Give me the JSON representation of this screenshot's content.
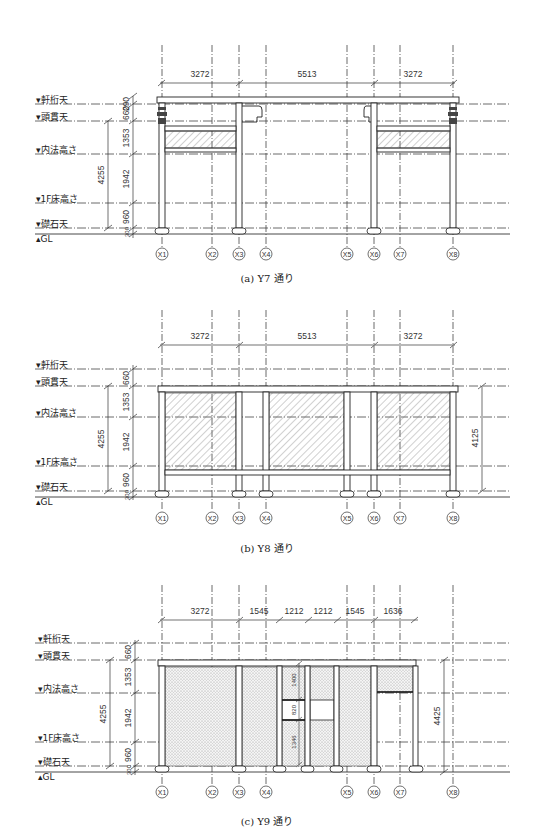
{
  "axes": {
    "x_labels": [
      "X1",
      "X2",
      "X3",
      "X4",
      "X5",
      "X6",
      "X7",
      "X8"
    ],
    "x_positions": [
      162,
      212,
      239,
      266,
      347,
      374,
      400,
      453
    ]
  },
  "levels": {
    "nokiketa": "軒桁天",
    "kashiranuki": "頭貫天",
    "uchinori": "内法高さ",
    "floor_1f": "1F床高さ",
    "soseki": "礎石天",
    "gl": "GL"
  },
  "vertical_dims": {
    "d290": "290",
    "d660": "660",
    "d1353": "1353",
    "d1942": "1942",
    "d960": "960",
    "d300": "300",
    "d4255": "4255"
  },
  "panels": [
    {
      "id": "a",
      "caption": "(a) Y7 通り",
      "top_dims": [
        "3272",
        "5513",
        "3272"
      ]
    },
    {
      "id": "b",
      "caption": "(b) Y8 通り",
      "top_dims": [
        "3272",
        "5513",
        "3272"
      ],
      "right_dim": "4125"
    },
    {
      "id": "c",
      "caption": "(c) Y9 通り",
      "top_dims": [
        "3272",
        "1545",
        "1212",
        "1212",
        "1545",
        "1636"
      ],
      "right_dim": "4425",
      "inner_dims": [
        "1400",
        "820",
        "1346"
      ]
    }
  ]
}
